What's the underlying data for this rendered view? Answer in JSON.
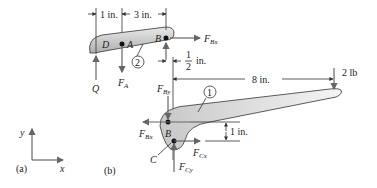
{
  "figure": {
    "part_a_label": "(a)",
    "part_b_label": "(b)",
    "axes": {
      "x": "x",
      "y": "y"
    },
    "member_2": {
      "circle_label": "2",
      "points": {
        "D": "D",
        "A": "A",
        "B": "B"
      },
      "dimensions": {
        "d_to_a": "1 in.",
        "a_to_b": "3 in."
      },
      "forces": {
        "q": "Q",
        "fa_main": "F",
        "fa_sub": "A",
        "fbx_main": "F",
        "fbx_sub": "Bx"
      }
    },
    "member_1": {
      "circle_label": "1",
      "points": {
        "B": "B",
        "C": "C"
      },
      "dimensions": {
        "half_num": "1",
        "half_den": "2",
        "half_unit": "in.",
        "length": "8 in.",
        "vertical": "1 in."
      },
      "load": "2 lb",
      "forces": {
        "fby_main": "F",
        "fby_sub": "By",
        "fbx_main": "F",
        "fbx_sub": "Bx",
        "fcx_main": "F",
        "fcx_sub": "Cx",
        "fcy_main": "F",
        "fcy_sub": "Cy"
      }
    },
    "colors": {
      "member_fill_light": "#eeeeee",
      "member_fill_dark": "#bbbbbb",
      "arrow": "#666666",
      "line": "#333333"
    }
  }
}
